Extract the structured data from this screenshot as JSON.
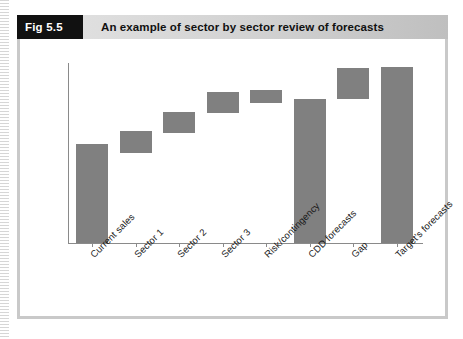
{
  "figure": {
    "tag": "Fig 5.5",
    "title": "An example of sector by sector review of forecasts"
  },
  "colors": {
    "bar": "#808080",
    "axis": "#8a8a8a",
    "header_tag_bg": "#111111",
    "header_band": "#d2d2d2",
    "box_border": "#c9c9c9"
  },
  "chart_data": {
    "type": "bar",
    "title": "An example of sector by sector review of forecasts",
    "xlabel": "",
    "ylabel": "",
    "grid": false,
    "legend": "none",
    "waterfall": true,
    "ylim": [
      0,
      100
    ],
    "categories": [
      "Current sales",
      "Sector 1",
      "Sector 2",
      "Sector 3",
      "Risk/contingency",
      "CDD forecasts",
      "Gap",
      "Target's forecasts"
    ],
    "bars": [
      {
        "label": "Current sales",
        "base": 0,
        "top": 55,
        "value": 55
      },
      {
        "label": "Sector 1",
        "base": 50,
        "top": 62,
        "value": 12
      },
      {
        "label": "Sector 2",
        "base": 61,
        "top": 73,
        "value": 12
      },
      {
        "label": "Sector 3",
        "base": 72,
        "top": 84,
        "value": 12
      },
      {
        "label": "Risk/contingency",
        "base": 78,
        "top": 85,
        "value": 7
      },
      {
        "label": "CDD forecasts",
        "base": 0,
        "top": 80,
        "value": 80
      },
      {
        "label": "Gap",
        "base": 80,
        "top": 97,
        "value": 17
      },
      {
        "label": "Target's forecasts",
        "base": 0,
        "top": 98,
        "value": 98
      }
    ]
  }
}
